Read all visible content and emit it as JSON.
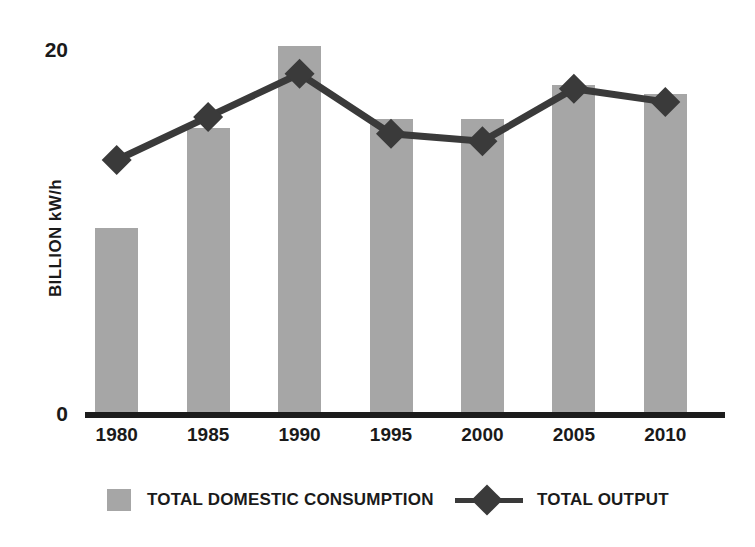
{
  "chart_data": {
    "type": "bar",
    "title": "",
    "subtitle": "",
    "xlabel": "",
    "ylabel": "BILLION kW/h",
    "categories": [
      "1980",
      "1985",
      "1990",
      "1995",
      "2000",
      "2005",
      "2010"
    ],
    "ylim": [
      0,
      20
    ],
    "ytick_labels": [
      "0",
      "20"
    ],
    "ytick_values": [
      0,
      20
    ],
    "grid": false,
    "legend_position": "bottom",
    "series": [
      {
        "name": "TOTAL DOMESTIC CONSUMPTION",
        "type": "bar",
        "color": "#a6a6a6",
        "values": [
          10.0,
          15.3,
          19.7,
          15.8,
          15.8,
          17.6,
          17.1
        ]
      },
      {
        "name": "TOTAL OUTPUT",
        "type": "line",
        "color": "#3a3a3a",
        "marker": "diamond",
        "values": [
          13.6,
          15.9,
          18.2,
          15.0,
          14.6,
          17.4,
          16.7
        ]
      }
    ]
  },
  "axis": {
    "y_title": "BILLION kW/h",
    "y_top_label": "20",
    "y_zero_label": "0"
  },
  "legend": {
    "consumption_label": "TOTAL DOMESTIC CONSUMPTION",
    "output_label": "TOTAL OUTPUT"
  },
  "colors": {
    "bar": "#a6a6a6",
    "line": "#3a3a3a",
    "axis": "#1c1c1c",
    "text": "#1a1a1a",
    "background": "#ffffff"
  }
}
